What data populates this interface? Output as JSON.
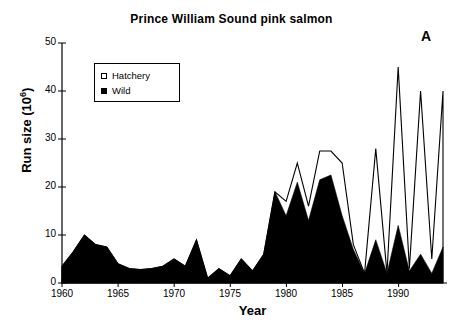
{
  "figure": {
    "title": "Prince William Sound pink salmon",
    "panel_label": "A"
  },
  "legend": {
    "items": [
      {
        "label": "Hatchery",
        "marker": "hollow-square-icon",
        "color": "#ffffff"
      },
      {
        "label": "Wild",
        "marker": "filled-square-icon",
        "color": "#000000"
      }
    ]
  },
  "axes": {
    "xlabel": "Year",
    "ylabel_text": "Run size (10",
    "ylabel_sup": "6",
    "ylabel_tail": ")",
    "ytick_labels": [
      "0",
      "10",
      "20",
      "30",
      "40",
      "50"
    ],
    "xtick_labels": [
      "1960",
      "1965",
      "1970",
      "1975",
      "1980",
      "1985",
      "1990"
    ]
  },
  "chart_data": {
    "type": "area",
    "title": "Prince William Sound pink salmon",
    "xlabel": "Year",
    "ylabel": "Run size (10^6)",
    "xlim": [
      1960,
      1994
    ],
    "ylim": [
      0,
      50
    ],
    "yticks": [
      0,
      10,
      20,
      30,
      40,
      50
    ],
    "xticks": [
      1960,
      1965,
      1970,
      1975,
      1980,
      1985,
      1990
    ],
    "grid": false,
    "legend_position": "upper-left-inside",
    "x": [
      1960,
      1961,
      1962,
      1963,
      1964,
      1965,
      1966,
      1967,
      1968,
      1969,
      1970,
      1971,
      1972,
      1973,
      1974,
      1975,
      1976,
      1977,
      1978,
      1979,
      1980,
      1981,
      1982,
      1983,
      1984,
      1985,
      1986,
      1987,
      1988,
      1989,
      1990,
      1991,
      1992,
      1993,
      1994
    ],
    "series": [
      {
        "name": "Wild",
        "fill": "#000000",
        "style": "filled-area",
        "values": [
          3.5,
          6.5,
          10.0,
          8.0,
          7.5,
          4.0,
          3.0,
          2.8,
          3.0,
          3.5,
          5.0,
          3.5,
          9.0,
          1.0,
          3.0,
          1.5,
          5.0,
          2.5,
          6.0,
          19.0,
          14.0,
          21.0,
          13.0,
          21.5,
          22.5,
          14.0,
          7.0,
          2.0,
          9.0,
          2.0,
          12.0,
          2.5,
          6.0,
          2.0,
          7.5
        ]
      },
      {
        "name": "Hatchery",
        "fill": "#ffffff",
        "style": "outlined-area-total",
        "note": "Upper outline is total run size (wild + hatchery); the white band between the black wild area and the outline is the hatchery component.",
        "total_values": [
          3.5,
          6.5,
          10.0,
          8.0,
          7.5,
          4.0,
          3.0,
          2.8,
          3.0,
          3.5,
          5.0,
          3.5,
          9.0,
          1.0,
          3.0,
          1.5,
          5.0,
          2.5,
          6.0,
          19.0,
          17.0,
          25.0,
          16.0,
          27.5,
          27.5,
          25.0,
          8.0,
          2.0,
          28.0,
          2.0,
          45.0,
          3.0,
          40.0,
          5.0,
          40.0
        ],
        "hatchery_values": [
          0,
          0,
          0,
          0,
          0,
          0,
          0,
          0,
          0,
          0,
          0,
          0,
          0,
          0,
          0,
          0,
          0,
          0,
          0,
          0,
          3.0,
          4.0,
          3.0,
          6.0,
          5.0,
          11.0,
          1.0,
          0,
          19.0,
          0,
          33.0,
          0.5,
          34.0,
          3.0,
          32.5
        ]
      }
    ]
  }
}
